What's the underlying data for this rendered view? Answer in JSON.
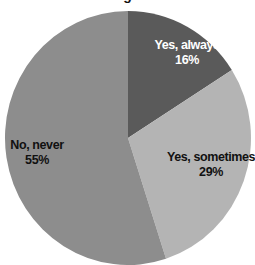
{
  "chart_data": {
    "type": "pie",
    "title": "",
    "title_visible_fragment": "g",
    "categories": [
      "Yes, always",
      "Yes, sometimes",
      "No, never"
    ],
    "values": [
      16,
      29,
      55
    ],
    "unit": "%",
    "colors": [
      "#5a5a5a",
      "#b4b4b4",
      "#8d8d8d"
    ],
    "label_colors": [
      "#ffffff",
      "#111111",
      "#111111"
    ],
    "start_angle_deg": 0,
    "direction": "clockwise",
    "legend": "none (labels inside slices)"
  },
  "labels": [
    {
      "name": "Yes, always",
      "pct": "16%"
    },
    {
      "name": "Yes, sometimes",
      "pct": "29%"
    },
    {
      "name": "No, never",
      "pct": "55%"
    }
  ],
  "title_fragment": "g"
}
